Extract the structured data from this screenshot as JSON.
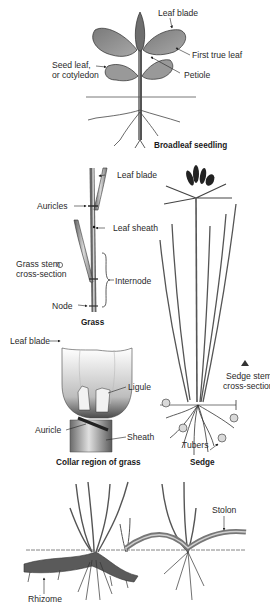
{
  "figure": {
    "panels": [
      {
        "id": "broadleaf",
        "caption": "Broadleaf seedling",
        "labels": {
          "leaf_blade": "Leaf blade",
          "first_true_leaf": "First true leaf",
          "seed_leaf_line1": "Seed leaf,",
          "seed_leaf_line2": "or cotyledon",
          "petiole": "Petiole"
        }
      },
      {
        "id": "grass",
        "caption": "Grass",
        "labels": {
          "leaf_blade": "Leaf blade",
          "auricles": "Auricles",
          "leaf_sheath": "Leaf sheath",
          "cross_section_line1": "Grass stem",
          "cross_section_line2": "cross-section",
          "internode": "Internode",
          "node": "Node"
        }
      },
      {
        "id": "sedge",
        "caption": "Sedge",
        "labels": {
          "cross_section_line1": "Sedge stem",
          "cross_section_line2": "cross-section",
          "tubers": "Tubers"
        }
      },
      {
        "id": "collar",
        "caption": "Collar region of grass",
        "labels": {
          "leaf_blade": "Leaf blade",
          "ligule": "Ligule",
          "auricle": "Auricle",
          "sheath": "Sheath"
        }
      },
      {
        "id": "rhizome_stolon",
        "caption": "",
        "labels": {
          "stolon": "Stolon",
          "rhizome": "Rhizome"
        }
      }
    ]
  },
  "colors": {
    "leaf_fill": "#8a8a8a",
    "leaf_light": "#cfcfcf",
    "outline": "#2b2b2b",
    "text": "#2a2a2a"
  }
}
